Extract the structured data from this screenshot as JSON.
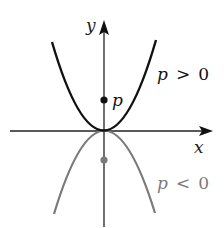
{
  "diagram": {
    "axes": {
      "x_label": "x",
      "y_label": "y"
    },
    "curves": [
      {
        "name": "upward-parabola",
        "condition_var": "p",
        "condition_op": ">",
        "condition_val": "0",
        "label": "p > 0",
        "color": "#111111"
      },
      {
        "name": "downward-parabola",
        "condition_var": "p",
        "condition_op": "<",
        "condition_val": "0",
        "label": "p < 0",
        "color": "#7a7a7a"
      }
    ],
    "points": [
      {
        "name": "focus-positive",
        "label": "p",
        "color": "#111111"
      },
      {
        "name": "focus-negative",
        "label": "",
        "color": "#7a7a7a"
      }
    ]
  }
}
